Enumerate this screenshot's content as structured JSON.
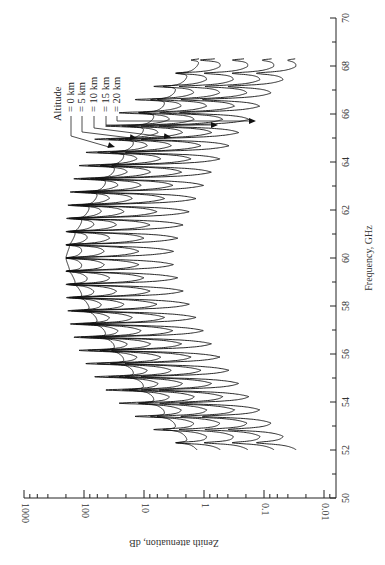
{
  "chart_data": {
    "type": "line",
    "orientation": "rotated-90",
    "title": "",
    "xlabel": "Frequency, GHz",
    "ylabel": "Zenith attenuation, dB",
    "xlim": [
      50,
      70
    ],
    "ylim": [
      0.01,
      1000
    ],
    "yscale": "log",
    "x_ticks": [
      50,
      52,
      54,
      56,
      58,
      60,
      62,
      64,
      66,
      68,
      70
    ],
    "x_tick_labels": [
      "50",
      "52",
      "54",
      "56",
      "58",
      "60",
      "62",
      "64",
      "66",
      "68",
      "70"
    ],
    "y_ticks": [
      1000,
      100,
      10,
      1,
      0.1,
      0.01
    ],
    "y_tick_labels": [
      "1000",
      "100",
      "10",
      "1",
      "0.1",
      "0.01"
    ],
    "legend_title": "Altitude",
    "frequency_range": [
      52,
      68.3
    ],
    "line_spacing_ghz": 0.55,
    "line_center_ghz": 60,
    "series": [
      {
        "name": "= 0 km",
        "altitude_km": 0,
        "envelope_peak_db": 200,
        "trough_center_db": 200,
        "edge_db": 1.0,
        "trough_depth_decades": 0.15
      },
      {
        "name": "= 5 km",
        "altitude_km": 5,
        "envelope_peak_db": 200,
        "trough_center_db": 110,
        "edge_db": 0.35,
        "trough_depth_decades": 0.35
      },
      {
        "name": "= 10 km",
        "altitude_km": 10,
        "envelope_peak_db": 200,
        "trough_center_db": 40,
        "edge_db": 0.12,
        "trough_depth_decades": 0.7
      },
      {
        "name": "= 15 km",
        "altitude_km": 15,
        "envelope_peak_db": 200,
        "trough_center_db": 8,
        "edge_db": 0.045,
        "trough_depth_decades": 1.1
      },
      {
        "name": "= 20 km",
        "altitude_km": 20,
        "envelope_peak_db": 200,
        "trough_center_db": 1.5,
        "edge_db": 0.02,
        "trough_depth_decades": 1.5
      }
    ],
    "legend_pointer_targets_ghz": [
      64.7,
      65.1,
      65.1,
      65.6,
      65.8
    ],
    "grid": false,
    "legend_position": "upper-left (rotated frame)"
  },
  "labels": {
    "xlabel": "Frequency, GHz",
    "ylabel": "Zenith attenuation, dB",
    "legend_title": "Altitude"
  }
}
